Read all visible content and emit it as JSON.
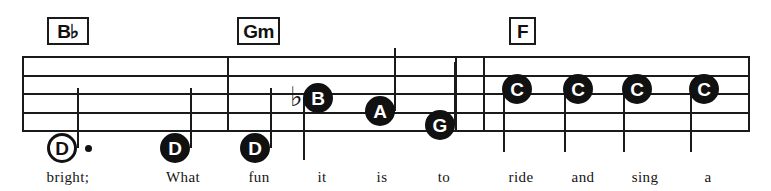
{
  "sheet": {
    "width": 771,
    "height": 191,
    "background": "#ffffff",
    "ink_color": "#111111",
    "staff": {
      "name": "five-line-staff",
      "left": 22,
      "right": 750,
      "line_y": [
        56,
        75,
        93,
        112,
        130
      ],
      "line_count": 5,
      "line_thickness": 2
    },
    "barlines": [
      {
        "name": "barline-1",
        "x": 227
      },
      {
        "name": "barline-2",
        "x": 455
      },
      {
        "name": "barline-3",
        "x": 483
      }
    ]
  },
  "chords": [
    {
      "name": "chord-bb",
      "label": "B♭",
      "x": 47,
      "y": 17,
      "width": 42,
      "height": 28
    },
    {
      "name": "chord-gm",
      "label": "Gm",
      "x": 237,
      "y": 17,
      "width": 43,
      "height": 28
    },
    {
      "name": "chord-f",
      "label": "F",
      "x": 509,
      "y": 17,
      "width": 27,
      "height": 28
    }
  ],
  "notes": [
    {
      "name": "note-d-1",
      "letter": "D",
      "head": "hollow",
      "duration": "half-dotted",
      "cx": 62,
      "cy": 148,
      "dotted": true,
      "dot_x": 85,
      "dot_y": 145,
      "stem": {
        "x": 77,
        "top": 88,
        "bottom": 148
      },
      "accidental": null
    },
    {
      "name": "note-d-2",
      "letter": "D",
      "head": "filled",
      "duration": "quarter",
      "cx": 175,
      "cy": 148,
      "dotted": false,
      "stem": {
        "x": 190,
        "top": 88,
        "bottom": 148
      },
      "accidental": null
    },
    {
      "name": "note-d-3",
      "letter": "D",
      "head": "filled",
      "duration": "quarter",
      "cx": 255,
      "cy": 148,
      "dotted": false,
      "stem": {
        "x": 270,
        "top": 88,
        "bottom": 148
      },
      "accidental": null
    },
    {
      "name": "note-b-flat",
      "letter": "B",
      "head": "filled",
      "duration": "quarter",
      "cx": 318,
      "cy": 98,
      "dotted": false,
      "stem": {
        "x": 303,
        "top": 98,
        "bottom": 160
      },
      "accidental": {
        "symbol": "♭",
        "x": 290,
        "y": 83
      }
    },
    {
      "name": "note-a",
      "letter": "A",
      "head": "filled",
      "duration": "quarter",
      "cx": 380,
      "cy": 111,
      "dotted": false,
      "stem": {
        "x": 394,
        "top": 48,
        "bottom": 111
      },
      "accidental": null
    },
    {
      "name": "note-g",
      "letter": "G",
      "head": "filled",
      "duration": "quarter",
      "cx": 440,
      "cy": 125,
      "dotted": false,
      "stem": {
        "x": 454,
        "top": 62,
        "bottom": 125
      },
      "accidental": null
    },
    {
      "name": "note-c-1",
      "letter": "C",
      "head": "filled",
      "duration": "quarter",
      "cx": 517,
      "cy": 89,
      "dotted": false,
      "stem": {
        "x": 503,
        "top": 89,
        "bottom": 152
      },
      "accidental": null
    },
    {
      "name": "note-c-2",
      "letter": "C",
      "head": "filled",
      "duration": "quarter",
      "cx": 578,
      "cy": 89,
      "dotted": false,
      "stem": {
        "x": 564,
        "top": 89,
        "bottom": 152
      },
      "accidental": null
    },
    {
      "name": "note-c-3",
      "letter": "C",
      "head": "filled",
      "duration": "quarter",
      "cx": 637,
      "cy": 89,
      "dotted": false,
      "stem": {
        "x": 623,
        "top": 89,
        "bottom": 152
      },
      "accidental": null
    },
    {
      "name": "note-c-4",
      "letter": "C",
      "head": "filled",
      "duration": "quarter",
      "cx": 704,
      "cy": 89,
      "dotted": false,
      "stem": {
        "x": 690,
        "top": 89,
        "bottom": 152
      },
      "accidental": null
    }
  ],
  "lyrics": [
    {
      "name": "lyric-bright",
      "text": "bright;",
      "x": 68,
      "y": 170
    },
    {
      "name": "lyric-what",
      "text": "What",
      "x": 183,
      "y": 170
    },
    {
      "name": "lyric-fun",
      "text": "fun",
      "x": 259,
      "y": 170
    },
    {
      "name": "lyric-it",
      "text": "it",
      "x": 322,
      "y": 170
    },
    {
      "name": "lyric-is",
      "text": "is",
      "x": 382,
      "y": 170
    },
    {
      "name": "lyric-to",
      "text": "to",
      "x": 444,
      "y": 170
    },
    {
      "name": "lyric-ride",
      "text": "ride",
      "x": 521,
      "y": 170
    },
    {
      "name": "lyric-and",
      "text": "and",
      "x": 583,
      "y": 170
    },
    {
      "name": "lyric-sing",
      "text": "sing",
      "x": 645,
      "y": 170
    },
    {
      "name": "lyric-a",
      "text": "a",
      "x": 708,
      "y": 170
    }
  ]
}
